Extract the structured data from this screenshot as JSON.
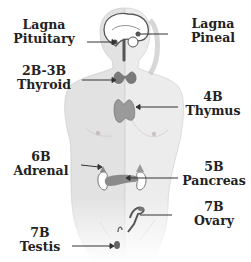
{
  "diagram": {
    "labels": [
      {
        "id": "pituitary",
        "code": "Lagna",
        "gland": "Pituitary"
      },
      {
        "id": "pineal",
        "code": "Lagna",
        "gland": "Pineal"
      },
      {
        "id": "thyroid",
        "code": "2B-3B",
        "gland": "Thyroid"
      },
      {
        "id": "thymus",
        "code": "4B",
        "gland": "Thymus"
      },
      {
        "id": "adrenal",
        "code": "6B",
        "gland": "Adrenal"
      },
      {
        "id": "pancreas",
        "code": "5B",
        "gland": "Pancreas"
      },
      {
        "id": "testis",
        "code": "7B",
        "gland": "Testis"
      },
      {
        "id": "ovary",
        "code": "7B",
        "gland": "Ovary"
      }
    ],
    "colors": {
      "body_left": "#e4e4e4",
      "body_right": "#ececec",
      "organ": "#8a8a8a",
      "arrow": "#333333",
      "text": "#222222"
    }
  }
}
